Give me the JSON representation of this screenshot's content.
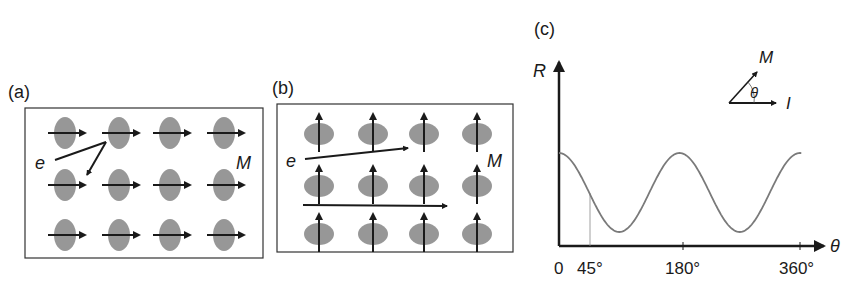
{
  "panels": {
    "a": {
      "label": "(a)",
      "electron_label": "e",
      "magnetization_label": "M",
      "spin_direction": "right",
      "rows": 3,
      "cols": 4
    },
    "b": {
      "label": "(b)",
      "electron_label": "e",
      "magnetization_label": "M",
      "spin_direction": "up",
      "rows": 3,
      "cols": 4
    },
    "c": {
      "label": "(c)",
      "y_axis_label": "R",
      "x_axis_label": "θ",
      "inset": {
        "m_label": "M",
        "theta_label": "θ",
        "i_label": "I"
      },
      "ticks": [
        "0",
        "45°",
        "180°",
        "360°"
      ]
    }
  },
  "colors": {
    "atom_fill": "#8c8c8c",
    "line": "#1a1a1a",
    "curve": "#7a7a7a",
    "box": "#333333"
  },
  "chart_data": {
    "type": "line",
    "title": "(c)",
    "xlabel": "θ",
    "ylabel": "R",
    "x_ticks": [
      "0",
      "45°",
      "180°",
      "360°"
    ],
    "function": "R = R0 + ΔR·cos²θ",
    "x": [
      0,
      45,
      90,
      135,
      180,
      225,
      270,
      315,
      360
    ],
    "values": [
      1.0,
      0.5,
      0.0,
      0.5,
      1.0,
      0.5,
      0.0,
      0.5,
      1.0
    ],
    "xlim": [
      0,
      360
    ],
    "grid": false,
    "annotations": [
      "vertical guide at 45°",
      "inset: M at angle θ to current I"
    ]
  }
}
